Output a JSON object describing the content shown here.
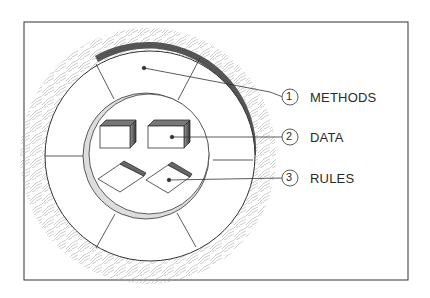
{
  "diagram": {
    "type": "concentric-ring-illustration",
    "layers": [
      {
        "number": "1",
        "label": "METHODS",
        "describes": "outer ring segments"
      },
      {
        "number": "2",
        "label": "DATA",
        "describes": "boxes in inner core"
      },
      {
        "number": "3",
        "label": "RULES",
        "describes": "diamond tiles in inner core"
      }
    ],
    "colors": {
      "line": "#2a2a2a",
      "shell": "#555555",
      "hatch": "#9a9a9a",
      "background": "#ffffff"
    }
  }
}
